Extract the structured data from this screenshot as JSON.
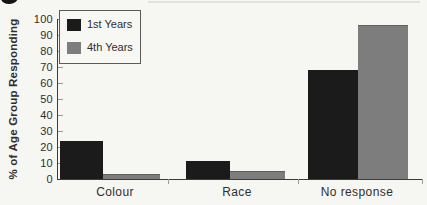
{
  "chart_data": {
    "type": "bar",
    "title": "",
    "categories": [
      "Colour",
      "Race",
      "No response"
    ],
    "series": [
      {
        "name": "1st Years",
        "color": "#1b1b1b",
        "values": [
          24,
          11,
          68
        ]
      },
      {
        "name": "4th Years",
        "color": "#7d7d7d",
        "values": [
          3,
          5,
          96
        ]
      }
    ],
    "xlabel": "",
    "ylabel": "% of Age Group Responding",
    "ylim": [
      0,
      100
    ],
    "yticks": [
      0,
      10,
      20,
      30,
      40,
      50,
      60,
      70,
      80,
      90,
      100
    ],
    "grid": false,
    "legend_position": "top-left"
  },
  "colors": {
    "background": "#f6f6f3",
    "axis": "#3c3c3c",
    "text": "#2e2e2e"
  }
}
